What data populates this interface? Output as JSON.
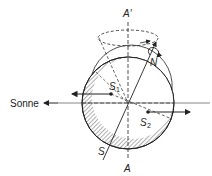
{
  "labels": {
    "sun": "Sonne",
    "axis_top": "A′",
    "axis_bottom": "A",
    "north": "N",
    "south": "S",
    "s1": "S",
    "s1_sub": "1",
    "s2": "S",
    "s2_sub": "2"
  },
  "colors": {
    "stroke": "#222222",
    "background": "#ffffff",
    "hatch": "#333333"
  }
}
